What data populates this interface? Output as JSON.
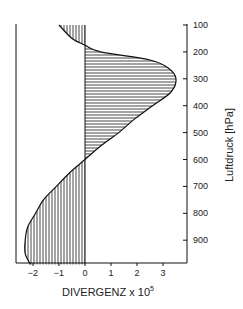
{
  "chart_data": {
    "type": "area",
    "title": "",
    "xlabel": "DIVERGENZ x 10",
    "xlabel_superscript": "5",
    "ylabel": "Luftdruck [hPa]",
    "x_ticks": [
      "-2",
      "-1",
      "0",
      "1",
      "2",
      "3"
    ],
    "y_ticks": [
      "100",
      "200",
      "300",
      "400",
      "500",
      "600",
      "700",
      "800",
      "900"
    ],
    "xlim": [
      -2.7,
      3.9
    ],
    "ylim": [
      1000,
      100
    ],
    "y_inverted": true,
    "grid": false,
    "series": [
      {
        "name": "Divergenz-Profil",
        "pressure_hPa": [
          100,
          150,
          175,
          200,
          230,
          260,
          300,
          350,
          400,
          450,
          500,
          550,
          600,
          650,
          700,
          750,
          800,
          850,
          900,
          950,
          990
        ],
        "divergence_x1e5": [
          -1.0,
          -0.5,
          0.0,
          0.6,
          2.5,
          3.2,
          3.5,
          3.3,
          2.6,
          1.9,
          1.3,
          0.6,
          0.0,
          -0.6,
          -1.1,
          -1.6,
          -1.9,
          -2.2,
          -2.3,
          -2.3,
          -2.1
        ]
      }
    ],
    "fill": {
      "positive": "horizontal hatching",
      "negative": "vertical hatching"
    }
  }
}
